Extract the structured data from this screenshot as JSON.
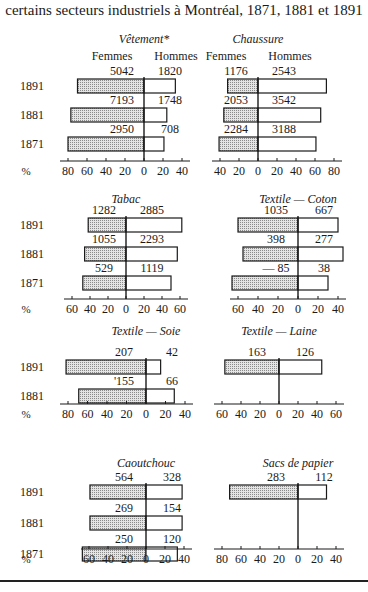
{
  "title": "certains secteurs industriels à Montréal, 1871, 1881 et 1891",
  "legend": {
    "left": "Femmes",
    "right": "Hommes",
    "percent_symbol": "%"
  },
  "colors": {
    "women_fill": "#c8c8c8",
    "men_fill": "#ffffff",
    "stroke": "#1a1a1a"
  },
  "chart_data": [
    {
      "type": "bar",
      "orientation": "horizontal-diverging",
      "title": "Vêtement*",
      "categories": [
        "1891",
        "1881",
        "1871"
      ],
      "series": [
        {
          "name": "Femmes",
          "percent": [
            70,
            77,
            80
          ],
          "counts": [
            "5042",
            "7193",
            "2950"
          ]
        },
        {
          "name": "Hommes",
          "percent": [
            33,
            24,
            21
          ],
          "counts": [
            "1820",
            "1748",
            "708"
          ]
        }
      ],
      "xticks_left": [
        80,
        60,
        40,
        20,
        0
      ],
      "xticks_right": [
        20,
        40
      ],
      "xlabel": "%"
    },
    {
      "type": "bar",
      "orientation": "horizontal-diverging",
      "title": "Chaussure",
      "categories": [
        "1891",
        "1881",
        "1871"
      ],
      "series": [
        {
          "name": "Femmes",
          "percent": [
            32,
            36,
            41
          ],
          "counts": [
            "1176",
            "2053",
            "2284"
          ]
        },
        {
          "name": "Hommes",
          "percent": [
            72,
            66,
            61
          ],
          "counts": [
            "2543",
            "3542",
            "3188"
          ]
        }
      ],
      "xticks_left": [
        40,
        20,
        0
      ],
      "xticks_right": [
        20,
        40,
        60,
        80
      ]
    },
    {
      "type": "bar",
      "orientation": "horizontal-diverging",
      "title": "Tabac",
      "categories": [
        "1891",
        "1881",
        "1871"
      ],
      "series": [
        {
          "name": "Femmes",
          "percent": [
            42,
            46,
            48
          ],
          "counts": [
            "1282",
            "1055",
            "529"
          ]
        },
        {
          "name": "Hommes",
          "percent": [
            62,
            57,
            50
          ],
          "counts": [
            "2885",
            "2293",
            "1119"
          ]
        }
      ],
      "xticks_left": [
        60,
        40,
        20,
        0
      ],
      "xticks_right": [
        20,
        40,
        60
      ],
      "xlabel": "%"
    },
    {
      "type": "bar",
      "orientation": "horizontal-diverging",
      "title": "Textile — Coton",
      "categories": [
        "1891",
        "1881",
        "1871"
      ],
      "series": [
        {
          "name": "Femmes",
          "percent": [
            60,
            55,
            66
          ],
          "counts": [
            "1035",
            "398",
            "— 85"
          ]
        },
        {
          "name": "Hommes",
          "percent": [
            40,
            45,
            30
          ],
          "counts": [
            "667",
            "277",
            "38"
          ]
        }
      ],
      "xticks_left": [
        60,
        40,
        20,
        0
      ],
      "xticks_right": [
        20,
        40
      ]
    },
    {
      "type": "bar",
      "orientation": "horizontal-diverging",
      "title": "Textile — Soie",
      "categories": [
        "1891",
        "1881"
      ],
      "series": [
        {
          "name": "Femmes",
          "percent": [
            82,
            69
          ],
          "counts": [
            "207",
            "'155"
          ]
        },
        {
          "name": "Hommes",
          "percent": [
            15,
            29
          ],
          "counts": [
            "42",
            "66"
          ]
        }
      ],
      "xticks_left": [
        80,
        60,
        40,
        20,
        0
      ],
      "xticks_right": [
        20,
        40
      ],
      "xlabel": "%"
    },
    {
      "type": "bar",
      "orientation": "horizontal-diverging",
      "title": "Textile — Laine",
      "categories": [
        "1891"
      ],
      "series": [
        {
          "name": "Femmes",
          "percent": [
            57
          ],
          "counts": [
            "163"
          ]
        },
        {
          "name": "Hommes",
          "percent": [
            45
          ],
          "counts": [
            "126"
          ]
        }
      ],
      "xticks_left": [
        60,
        40,
        20,
        0
      ],
      "xticks_right": [
        20,
        40,
        60
      ]
    },
    {
      "type": "bar",
      "orientation": "horizontal-diverging",
      "title": "Caoutchouc",
      "categories": [
        "1891",
        "1881",
        "1871"
      ],
      "series": [
        {
          "name": "Femmes",
          "percent": [
            59,
            59,
            67
          ],
          "counts": [
            "564",
            "269",
            "250"
          ]
        },
        {
          "name": "Hommes",
          "percent": [
            38,
            38,
            33
          ],
          "counts": [
            "328",
            "154",
            "120"
          ]
        }
      ],
      "xticks_left": [
        60,
        40,
        20,
        0
      ],
      "xticks_right": [
        20,
        40
      ],
      "xlabel": "%"
    },
    {
      "type": "bar",
      "orientation": "horizontal-diverging",
      "title": "Sacs de papier",
      "categories": [
        "1891"
      ],
      "series": [
        {
          "name": "Femmes",
          "percent": [
            72
          ],
          "counts": [
            "283"
          ]
        },
        {
          "name": "Hommes",
          "percent": [
            30
          ],
          "counts": [
            "112"
          ]
        }
      ],
      "xticks_left": [
        80,
        60,
        40,
        20,
        0
      ],
      "xticks_right": [
        20,
        40
      ]
    }
  ]
}
